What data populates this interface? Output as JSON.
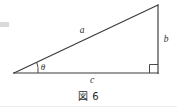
{
  "figure": {
    "caption": "図 6",
    "labels": {
      "hypotenuse": "a",
      "vertical": "b",
      "horizontal": "c",
      "angle": "θ"
    },
    "geometry": {
      "vertex_left": [
        14,
        73
      ],
      "vertex_bottom_right": [
        158,
        73
      ],
      "vertex_top_right": [
        158,
        5
      ],
      "angle_arc_radius": 24,
      "right_angle_size": 7
    },
    "colors": {
      "stroke": "#3a3a3a",
      "label": "#2e2e2e",
      "background": "#ffffff",
      "caption": "#1f1f1f",
      "smudge": "#d9d9d9",
      "rule": "#ededed"
    },
    "label_positions": {
      "hypotenuse": [
        82,
        33
      ],
      "vertical": [
        164,
        42
      ],
      "horizontal": [
        92,
        82
      ],
      "angle": [
        41,
        70
      ]
    }
  }
}
